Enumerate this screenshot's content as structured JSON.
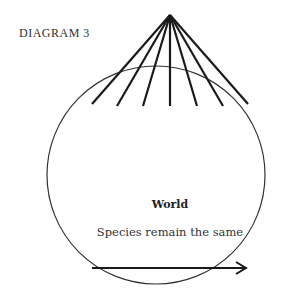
{
  "diagram": {
    "caption": "DIAGRAM 3",
    "world_label": "World",
    "arrow_label": "Species remain the same",
    "rays": 7,
    "colors": {
      "stroke": "#1a1a1a",
      "text": "#333333"
    }
  }
}
